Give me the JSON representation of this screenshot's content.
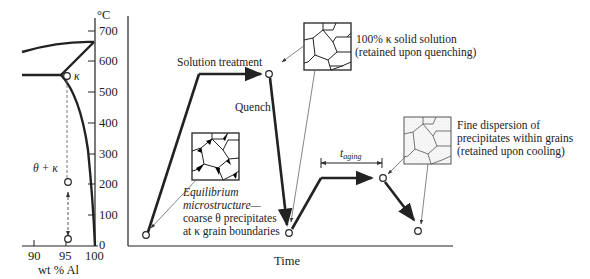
{
  "phase_diagram": {
    "y_unit": "°C",
    "y_ticks": [
      "700",
      "600",
      "500",
      "400",
      "300",
      "200",
      "100",
      "0"
    ],
    "x_ticks": [
      "90",
      "95",
      "100"
    ],
    "x_label": "wt % Al",
    "phase_label_kappa": "κ",
    "phase_label_theta_kappa": "θ + κ"
  },
  "heat_treatment": {
    "x_label": "Time",
    "solution_treatment_label": "Solution treatment",
    "quench_label": "Quench",
    "aging_time_label_main": "t",
    "aging_time_label_sub": "aging"
  },
  "annotations": {
    "equilibrium": {
      "line1": "Equilibrium",
      "line2": "microstructure—",
      "line3": "coarse θ precipitates",
      "line4": "at κ grain boundaries"
    },
    "solid_solution": {
      "line1": "100% κ solid solution",
      "line2": "(retained upon quenching)"
    },
    "fine_dispersion": {
      "line1": "Fine dispersion of",
      "line2": "precipitates within grains",
      "line3": "(retained upon cooling)"
    }
  },
  "colors": {
    "ink": "#222222",
    "dashed": "#777777",
    "leader": "#666666",
    "precipitate": "#000000",
    "stipple": "#cfcfcf"
  }
}
